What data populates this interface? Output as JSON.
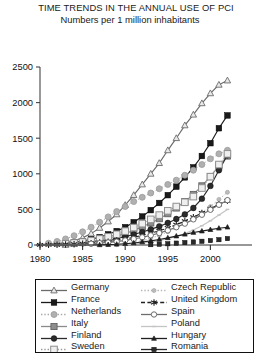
{
  "chart_data": {
    "type": "line",
    "title": "TIME TRENDS IN THE ANNUAL USE OF PCI",
    "subtitle": "Numbers per 1 million inhabitants",
    "xlabel": "",
    "ylabel": "",
    "xlim": [
      1979,
      2003
    ],
    "ylim": [
      0,
      2500
    ],
    "xticks": [
      1980,
      1985,
      1990,
      1995,
      2000
    ],
    "yticks": [
      0,
      500,
      1000,
      1500,
      2000,
      2500
    ],
    "grid": false,
    "legend_position": "below-plot",
    "x": [
      1980,
      1981,
      1982,
      1983,
      1984,
      1985,
      1986,
      1987,
      1988,
      1989,
      1990,
      1991,
      1992,
      1993,
      1994,
      1995,
      1996,
      1997,
      1998,
      1999,
      2000,
      2001,
      2002
    ],
    "series": [
      {
        "name": "Germany",
        "marker": "open-triangle",
        "line": "solid",
        "color": "#6b6b6b",
        "values": [
          5,
          10,
          20,
          35,
          60,
          100,
          160,
          240,
          330,
          430,
          560,
          700,
          850,
          1000,
          1150,
          1330,
          1500,
          1680,
          1830,
          1990,
          2130,
          2250,
          2310
        ]
      },
      {
        "name": "France",
        "marker": "filled-square",
        "line": "solid",
        "color": "#1a1a1a",
        "values": [
          3,
          6,
          12,
          22,
          35,
          55,
          80,
          110,
          150,
          195,
          250,
          320,
          400,
          490,
          590,
          700,
          820,
          950,
          1090,
          1250,
          1430,
          1640,
          1820
        ]
      },
      {
        "name": "Netherlands",
        "marker": "dotted-circle",
        "line": "dotted",
        "color": "#a8a8a8",
        "values": [
          10,
          25,
          50,
          85,
          130,
          185,
          250,
          320,
          395,
          470,
          540,
          610,
          670,
          730,
          790,
          850,
          910,
          980,
          1050,
          1130,
          1210,
          1280,
          1330
        ]
      },
      {
        "name": "Italy",
        "marker": "gray-square",
        "line": "solid",
        "color": "#8a8a8a",
        "values": [
          2,
          4,
          8,
          14,
          22,
          34,
          50,
          70,
          95,
          125,
          160,
          205,
          255,
          310,
          370,
          440,
          520,
          610,
          710,
          830,
          960,
          1110,
          1250
        ]
      },
      {
        "name": "Finland",
        "marker": "filled-circle",
        "line": "solid",
        "color": "#2b2b2b",
        "values": [
          2,
          4,
          7,
          12,
          18,
          26,
          38,
          52,
          70,
          92,
          118,
          148,
          182,
          220,
          262,
          310,
          365,
          430,
          520,
          650,
          830,
          1050,
          1260
        ]
      },
      {
        "name": "Sweden",
        "marker": "open-square",
        "line": "dotted",
        "color": "#9a9a9a",
        "values": [
          2,
          5,
          10,
          18,
          28,
          42,
          60,
          85,
          115,
          150,
          195,
          245,
          300,
          360,
          420,
          480,
          540,
          600,
          680,
          800,
          960,
          1130,
          1280
        ]
      },
      {
        "name": "Czech Republic",
        "marker": "small-dot",
        "line": "dotted",
        "color": "#b5b5b5",
        "values": [
          0,
          0,
          0,
          0,
          0,
          0,
          0,
          0,
          0,
          5,
          15,
          35,
          60,
          95,
          135,
          185,
          240,
          300,
          370,
          450,
          540,
          640,
          740
        ]
      },
      {
        "name": "United Kingdom",
        "marker": "star",
        "line": "dashed",
        "color": "#222222",
        "values": [
          1,
          2,
          4,
          7,
          11,
          17,
          25,
          35,
          48,
          64,
          84,
          108,
          135,
          165,
          200,
          240,
          285,
          335,
          390,
          450,
          510,
          570,
          620
        ]
      },
      {
        "name": "Spain",
        "marker": "open-circle",
        "line": "solid",
        "color": "#6e6e6e",
        "values": [
          1,
          2,
          3,
          5,
          8,
          12,
          18,
          26,
          36,
          48,
          64,
          84,
          108,
          136,
          168,
          205,
          250,
          300,
          360,
          425,
          495,
          565,
          630
        ]
      },
      {
        "name": "Poland",
        "marker": "thin-line",
        "line": "solid",
        "color": "#c4c4c4",
        "values": [
          0,
          0,
          0,
          0,
          0,
          0,
          0,
          0,
          0,
          2,
          6,
          14,
          26,
          42,
          62,
          88,
          120,
          160,
          210,
          270,
          340,
          420,
          500
        ]
      },
      {
        "name": "Hungary",
        "marker": "small-triangle",
        "line": "solid",
        "color": "#1f1f1f",
        "values": [
          0,
          0,
          0,
          0,
          0,
          0,
          0,
          2,
          5,
          10,
          18,
          28,
          42,
          58,
          78,
          100,
          125,
          150,
          175,
          195,
          215,
          235,
          250
        ]
      },
      {
        "name": "Romania",
        "marker": "small-filled-square",
        "line": "none",
        "color": "#2a2a2a",
        "values": [
          0,
          0,
          0,
          0,
          0,
          0,
          0,
          0,
          0,
          0,
          0,
          0,
          0,
          5,
          10,
          18,
          26,
          34,
          42,
          52,
          62,
          75,
          90
        ]
      }
    ]
  },
  "legend": {
    "left_column": [
      {
        "label": "Germany"
      },
      {
        "label": "France"
      },
      {
        "label": "Netherlands"
      },
      {
        "label": "Italy"
      },
      {
        "label": "Finland"
      },
      {
        "label": "Sweden"
      }
    ],
    "right_column": [
      {
        "label": "Czech Republic"
      },
      {
        "label": "United Kingdom"
      },
      {
        "label": "Spain"
      },
      {
        "label": "Poland"
      },
      {
        "label": "Hungary"
      },
      {
        "label": "Romania"
      }
    ]
  }
}
